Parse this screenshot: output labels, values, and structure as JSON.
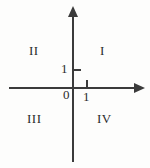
{
  "figure": {
    "type": "coordinate-plane-quadrant-diagram",
    "background_color": "#fdfdfc",
    "line_color": "#3b3b3b",
    "text_color": "#2b2b2b"
  },
  "axes": {
    "x_axis_name": "x-axis",
    "y_axis_name": "y-axis",
    "x_arrow_direction": "right",
    "y_arrow_direction": "up",
    "origin_label": "0",
    "ticks": {
      "x": [
        {
          "value": "1",
          "label": "1"
        }
      ],
      "y": [
        {
          "value": "1",
          "label": "1"
        }
      ]
    }
  },
  "quadrants": [
    {
      "id": "i",
      "label": "I",
      "position": "top-right"
    },
    {
      "id": "ii",
      "label": "II",
      "position": "top-left"
    },
    {
      "id": "iii",
      "label": "III",
      "position": "bottom-left"
    },
    {
      "id": "iv",
      "label": "IV",
      "position": "bottom-right"
    }
  ],
  "artifacts": {
    "top_edge_text": ""
  },
  "chart_data": {
    "type": "scatter",
    "title": "",
    "xlabel": "",
    "ylabel": "",
    "xlim": [
      -2.2,
      2.2
    ],
    "ylim": [
      -2.4,
      2.4
    ],
    "grid": false,
    "legend": "none",
    "x_ticks": [
      1
    ],
    "x_tick_labels": [
      "1"
    ],
    "y_ticks": [
      1
    ],
    "y_tick_labels": [
      "1"
    ],
    "origin_label": "0",
    "annotations": [
      {
        "text": "I",
        "x": 1.0,
        "y": 1.45
      },
      {
        "text": "II",
        "x": -1.0,
        "y": 1.45
      },
      {
        "text": "III",
        "x": -1.05,
        "y": -1.1
      },
      {
        "text": "IV",
        "x": 1.0,
        "y": -1.1
      }
    ],
    "series": [],
    "values": []
  }
}
